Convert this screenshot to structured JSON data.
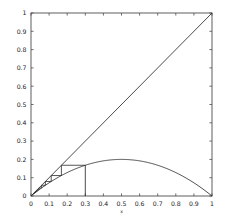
{
  "figure": {
    "background": "#ffffff",
    "frame_color": "#4d4d4d",
    "line_color": "#2b2b2b",
    "tick_label_color": "#1a1a1a"
  },
  "chart_data": {
    "type": "line",
    "title": "",
    "subtitle": "",
    "xlabel": "x",
    "ylabel": "",
    "xlim": [
      0,
      1
    ],
    "ylim": [
      0,
      1
    ],
    "grid": false,
    "legend": false,
    "legend_position": "none",
    "xticklabels": [
      "0",
      "0.1",
      "0.2",
      "0.3",
      "0.4",
      "0.5",
      "0.6",
      "0.7",
      "0.8",
      "0.9",
      "1"
    ],
    "xtickvalues": [
      0,
      0.1,
      0.2,
      0.3,
      0.4,
      0.5,
      0.6,
      0.7,
      0.8,
      0.9,
      1
    ],
    "yticklabels": [
      "0",
      "0.1",
      "0.2",
      "0.3",
      "0.4",
      "0.5",
      "0.6",
      "0.7",
      "0.8",
      "0.9",
      "1"
    ],
    "ytickvalues": [
      0,
      0.1,
      0.2,
      0.3,
      0.4,
      0.5,
      0.6,
      0.7,
      0.8,
      0.9,
      1
    ],
    "series": [
      {
        "name": "identity",
        "kind": "line",
        "label": "y = x",
        "x": [
          0,
          1
        ],
        "values": [
          0,
          1
        ]
      },
      {
        "name": "logistic-map",
        "kind": "curve",
        "label": "f(x) = 3.2 x (1 - x) / 4",
        "parabola_peak_x": 0.5,
        "parabola_peak_y": 0.2,
        "x": [
          0,
          0.05,
          0.1,
          0.15,
          0.2,
          0.25,
          0.3,
          0.35,
          0.4,
          0.45,
          0.5,
          0.55,
          0.6,
          0.65,
          0.7,
          0.75,
          0.8,
          0.85,
          0.9,
          0.95,
          1
        ],
        "values": [
          0,
          0.038,
          0.072,
          0.102,
          0.128,
          0.15,
          0.168,
          0.182,
          0.192,
          0.198,
          0.2,
          0.198,
          0.192,
          0.182,
          0.168,
          0.15,
          0.128,
          0.102,
          0.072,
          0.038,
          0
        ]
      },
      {
        "name": "initial-vertical",
        "kind": "segment",
        "label": "x0 = 0.3 vertical",
        "x": [
          0.3,
          0.3
        ],
        "values": [
          0,
          0.168
        ]
      },
      {
        "name": "cobweb-orbit",
        "kind": "staircase",
        "label": "cobweb iteration toward 0",
        "points_x": [
          0.3,
          0.168,
          0.168,
          0.1118,
          0.1118,
          0.0794,
          0.0794,
          0.0585,
          0.0585,
          0.0441,
          0.0441,
          0.0337,
          0.0337,
          0.0261,
          0.0261,
          0.0203,
          0.0203,
          0.0159,
          0.0159,
          0.0125
        ],
        "points_y": [
          0.168,
          0.168,
          0.1118,
          0.1118,
          0.0794,
          0.0794,
          0.0585,
          0.0585,
          0.0441,
          0.0441,
          0.0337,
          0.0337,
          0.0261,
          0.0261,
          0.0203,
          0.0203,
          0.0159,
          0.0159,
          0.0125,
          0.0125
        ]
      }
    ],
    "annotations": [
      {
        "name": "fixed-point-origin",
        "x": 0,
        "y": 0,
        "text": ""
      }
    ]
  }
}
